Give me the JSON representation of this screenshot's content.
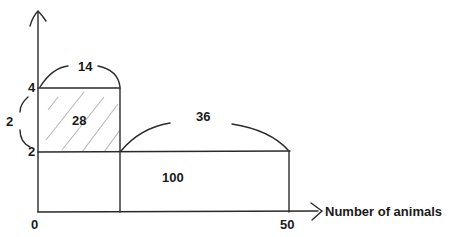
{
  "diagram": {
    "x_axis": {
      "label": "Number of animals",
      "ticks": [
        "0",
        "50"
      ]
    },
    "y_axis": {
      "ticks": [
        "2",
        "4"
      ]
    },
    "regions": [
      {
        "name": "top-left-rectangle",
        "area_label": "28",
        "hatched": true,
        "width_label": "14",
        "height_label": "2"
      },
      {
        "name": "bottom-rectangle",
        "area_label": "100",
        "hatched": false
      },
      {
        "name": "right-extension",
        "width_label": "36"
      }
    ],
    "colors": {
      "lines": "#2a2a2a",
      "hatch": "#b8b8b8",
      "background": "#ffffff"
    }
  }
}
